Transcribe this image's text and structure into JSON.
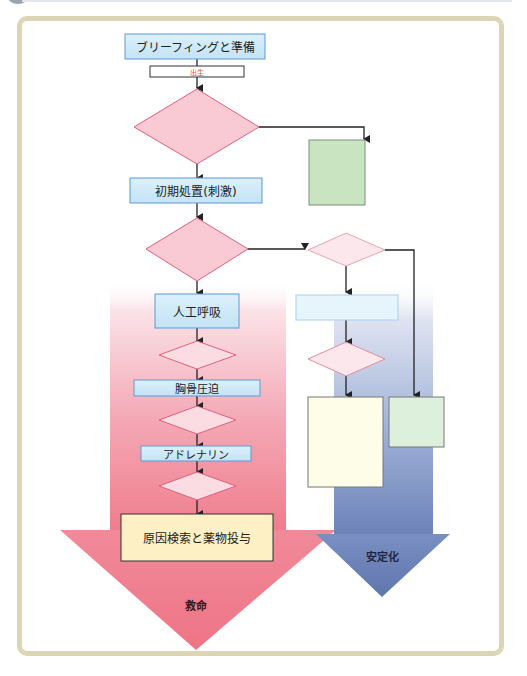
{
  "diagram": {
    "title": "",
    "nodes": {
      "briefing": "ブリーフィングと準備",
      "birth": "出生",
      "initial_steps": "初期処置(刺激)",
      "ventilation": "人工呼吸",
      "chest_compressions": "胸骨圧迫",
      "adrenaline": "アドレナリン",
      "cause_and_drugs": "原因検索と薬物投与"
    },
    "arrows": {
      "resuscitation": "救命",
      "stabilization": "安定化"
    },
    "colors": {
      "frame": "#ddd6b4",
      "process_box": "#cfe9f7",
      "process_border": "#5b9bd5",
      "decision_fill": "#f9c9d4",
      "decision_border": "#e0607e",
      "green_box": "#c9e4c0",
      "yellow_box": "#fdf0c4",
      "pink_arrow": "#ef7d8d",
      "blue_arrow": "#6b82b8",
      "birth_text": "#e05a2b"
    }
  }
}
